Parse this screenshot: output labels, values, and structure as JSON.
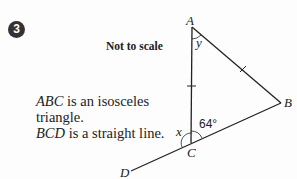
{
  "question": {
    "number": "3",
    "note": "Not to scale",
    "statements": [
      {
        "italic": "ABC",
        "text": " is an isosceles"
      },
      {
        "italic": "",
        "text": "triangle."
      },
      {
        "italic": "BCD",
        "text": " is a straight line."
      }
    ]
  },
  "diagram": {
    "points": {
      "A": "A",
      "B": "B",
      "C": "C",
      "D": "D"
    },
    "angles": {
      "at_A": "y",
      "at_C_inside": "64°",
      "at_C_outside": "x"
    },
    "equal_sides": [
      "AC",
      "AB"
    ]
  }
}
